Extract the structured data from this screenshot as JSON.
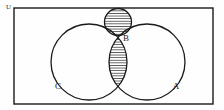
{
  "figure": {
    "kind": "venn-diagram",
    "background_color": "#fefefe",
    "stroke_color": "#1a1a1a",
    "hatch_color": "#1a1a1a",
    "width": 224,
    "height": 110
  },
  "universe": {
    "label": "U",
    "label_x": 6,
    "label_y": 9,
    "rect": {
      "x": 14,
      "y": 8,
      "width": 199,
      "height": 96
    },
    "stroke_width": 1.4
  },
  "sets": [
    {
      "id": "C",
      "label": "C",
      "label_x": 58,
      "label_y": 89,
      "cx": 89,
      "cy": 62,
      "r": 38,
      "stroke_width": 1.3
    },
    {
      "id": "A",
      "label": "A",
      "label_x": 176,
      "label_y": 89,
      "cx": 147,
      "cy": 62,
      "r": 38,
      "stroke_width": 1.3
    },
    {
      "id": "B",
      "label": "B",
      "label_x": 126,
      "label_y": 41,
      "cx": 118,
      "cy": 22,
      "r": 13.5,
      "stroke_width": 1.3
    }
  ],
  "shaded_regions": [
    {
      "id": "A-intersect-C",
      "description": "lens intersection of circles A and C",
      "fill_pattern": "horizontal-hatch"
    },
    {
      "id": "B-interior",
      "description": "interior of small circle B",
      "fill_pattern": "horizontal-hatch"
    }
  ],
  "hatch": {
    "spacing": 2.6,
    "line_width": 0.75,
    "orientation": "horizontal"
  }
}
